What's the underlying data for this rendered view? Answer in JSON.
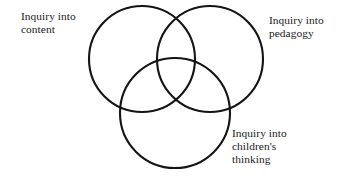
{
  "diagram": {
    "type": "venn-three-circle",
    "background_color": "#ffffff",
    "stroke_color": "#141414",
    "text_color": "#1a1a1a",
    "circles": [
      {
        "name": "content",
        "cx": 142,
        "cy": 59,
        "r": 53
      },
      {
        "name": "pedagogy",
        "cx": 210,
        "cy": 59,
        "r": 53
      },
      {
        "name": "children-thinking",
        "cx": 175,
        "cy": 113,
        "r": 55
      }
    ],
    "labels": {
      "content": "Inquiry into\ncontent",
      "pedagogy": "Inquiry into\npedagogy",
      "thinking": "Inquiry into\nchildren's\nthinking"
    }
  }
}
